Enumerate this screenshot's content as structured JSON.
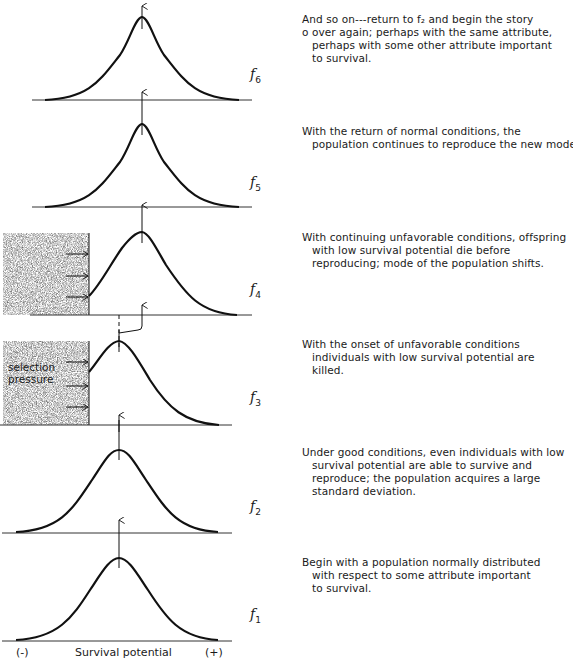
{
  "panels": [
    {
      "id": "f6",
      "label": "f",
      "subscript": "6",
      "caption": [
        "And so on---return to f₂ and begin the story",
        "o over again; perhaps with the same attribute,",
        "perhaps with some other attribute important",
        "to survival."
      ]
    },
    {
      "id": "f5",
      "label": "f",
      "subscript": "5",
      "caption": [
        "With the return of normal conditions, the",
        "population  continues to reproduce the new mode."
      ]
    },
    {
      "id": "f4",
      "label": "f",
      "subscript": "4",
      "caption": [
        "With continuing unfavorable conditions, offspring",
        "with low survival  potential die before",
        "reproducing; mode of the population shifts."
      ]
    },
    {
      "id": "f3",
      "label": "f",
      "subscript": "3",
      "caption": [
        "With the onset of unfavorable conditions",
        "individuals with low survival potential are",
        "killed."
      ]
    },
    {
      "id": "f2",
      "label": "f",
      "subscript": "2",
      "caption": [
        "Under good conditions, even individuals with low",
        "survival potential are able to survive and",
        "reproduce; the population acquires a large",
        "standard deviation."
      ]
    },
    {
      "id": "f1",
      "label": "f",
      "subscript": "1",
      "caption": [
        "Begin with a population normally distributed",
        "with respect to some attribute important",
        "to survival."
      ]
    }
  ],
  "selection_label": [
    "selection",
    "pressure"
  ],
  "axis": {
    "minus": "(-)",
    "title": "Survival potential",
    "plus": "(+)"
  }
}
